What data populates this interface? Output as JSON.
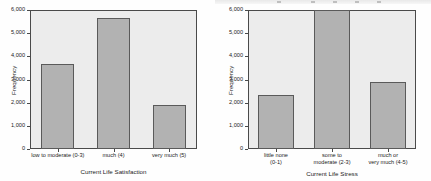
{
  "chart_data": [
    {
      "type": "bar",
      "id": "life-satisfaction",
      "title": "",
      "xlabel": "Current Life Satisfaction",
      "ylabel": "Frequency",
      "categories": [
        "low to moderate (0-3)",
        "much (4)",
        "very much (5)"
      ],
      "values": [
        3650,
        5650,
        1900
      ],
      "ylim": [
        0,
        6000
      ],
      "ytick_labels": [
        "0",
        "1,000",
        "2,000",
        "3,000",
        "4,000",
        "5,000",
        "6,000"
      ],
      "ytick_values": [
        0,
        1000,
        2000,
        3000,
        4000,
        5000,
        6000
      ],
      "grid": false,
      "legend": "none",
      "bar_color": "#b2b2b2",
      "bar_edge_color": "#5a5a5a",
      "plot_background": "#ececec"
    },
    {
      "type": "bar",
      "id": "life-stress",
      "title": "",
      "xlabel": "Current Life Stress",
      "ylabel": "Frequency",
      "categories": [
        "little none\n(0-1)",
        "some to\nmoderate (2-3)",
        "much or\nvery much (4-5)"
      ],
      "values": [
        2350,
        6000,
        2900
      ],
      "ylim": [
        0,
        6000
      ],
      "ytick_labels": [
        "0",
        "1,000",
        "2,000",
        "3,000",
        "4,000",
        "5,000",
        "6,000"
      ],
      "ytick_values": [
        0,
        1000,
        2000,
        3000,
        4000,
        5000,
        6000
      ],
      "grid": false,
      "legend": "none",
      "bar_color": "#b2b2b2",
      "bar_edge_color": "#5a5a5a",
      "plot_background": "#ececec"
    }
  ]
}
